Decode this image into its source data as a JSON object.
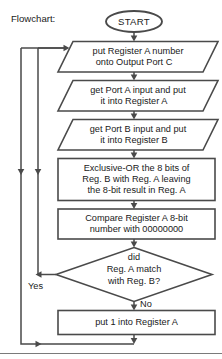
{
  "caption": {
    "label": "Flowchart:"
  },
  "colors": {
    "stroke": "#4a4a4a",
    "text": "#1a1a1a",
    "background": "#ffffff",
    "rule": "#7a7a7a"
  },
  "nodes": {
    "start": {
      "type": "terminator",
      "label": "START"
    },
    "output_port_c": {
      "type": "io-parallelogram",
      "line1": "put Register A number",
      "line2": "onto Output Port C"
    },
    "input_port_a": {
      "type": "io-parallelogram",
      "line1": "get Port A input and put",
      "line2": "it into Register A"
    },
    "input_port_b": {
      "type": "io-parallelogram",
      "line1": "get Port B input and put",
      "line2": "it into Register B"
    },
    "exclusive_or": {
      "type": "process-rectangle",
      "line1": "Exclusive-OR the 8 bits of",
      "line2": "Reg. B with Reg. A leaving",
      "line3": "the 8-bit result in Reg. A"
    },
    "compare": {
      "type": "process-rectangle",
      "line1": "Compare Register A 8-bit",
      "line2": "number with 00000000"
    },
    "decision": {
      "type": "decision-diamond",
      "line1": "did",
      "line2": "Reg. A match",
      "line3": "with Reg. B?"
    },
    "put_one": {
      "type": "process-rectangle",
      "line1": "put 1 into Register A"
    }
  },
  "branches": {
    "yes_label": "Yes",
    "no_label": "No"
  }
}
